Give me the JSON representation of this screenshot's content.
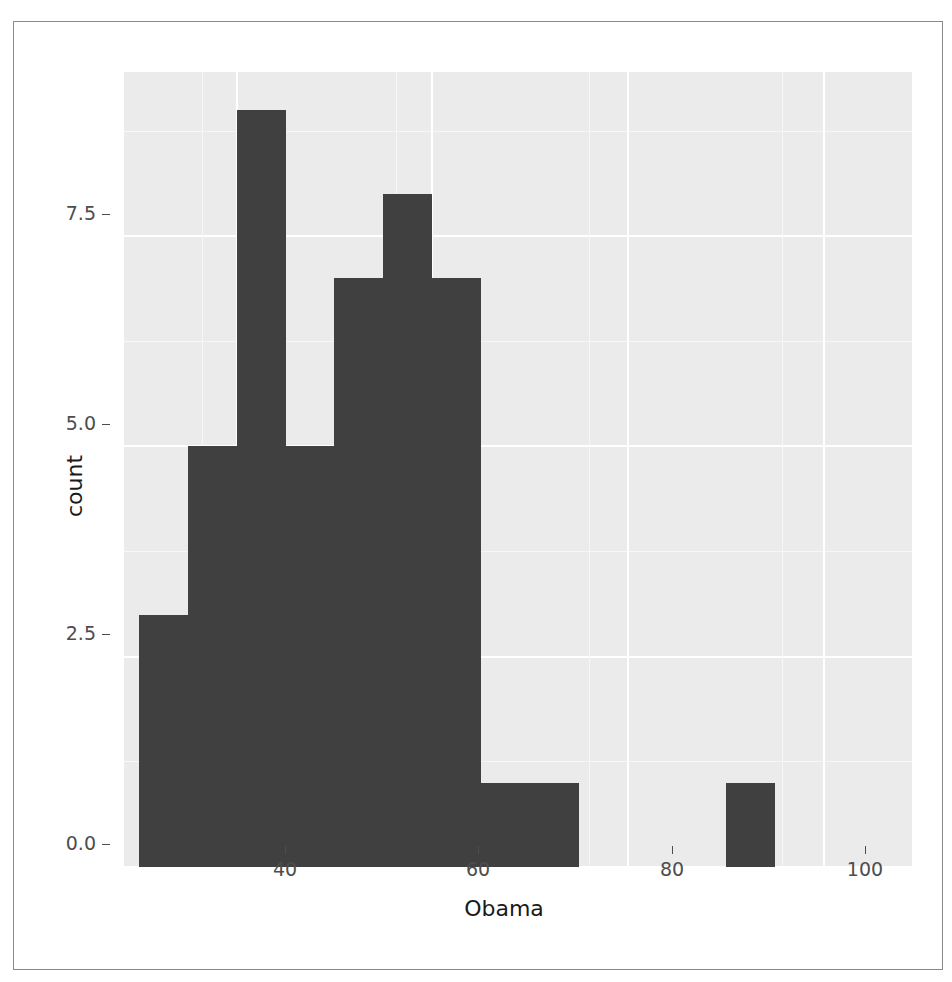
{
  "chart_data": {
    "type": "bar",
    "title": "",
    "subtitle": "",
    "xlabel": "Obama",
    "ylabel": "count",
    "xlim": [
      28.5,
      109.0
    ],
    "ylim": [
      0,
      9.45
    ],
    "grid": true,
    "legend": "none",
    "x_ticks": [
      {
        "value": 40,
        "label": "40"
      },
      {
        "value": 60,
        "label": "60"
      },
      {
        "value": 80,
        "label": "80"
      },
      {
        "value": 100,
        "label": "100"
      }
    ],
    "y_ticks": [
      {
        "value": 0.0,
        "label": "0.0"
      },
      {
        "value": 2.5,
        "label": "2.5"
      },
      {
        "value": 5.0,
        "label": "5.0"
      },
      {
        "value": 7.5,
        "label": "7.5"
      }
    ],
    "bin_width": 5,
    "bins": [
      {
        "x0": 30,
        "x1": 35,
        "count": 3
      },
      {
        "x0": 35,
        "x1": 40,
        "count": 5
      },
      {
        "x0": 40,
        "x1": 45,
        "count": 9
      },
      {
        "x0": 45,
        "x1": 50,
        "count": 5
      },
      {
        "x0": 50,
        "x1": 55,
        "count": 7
      },
      {
        "x0": 55,
        "x1": 60,
        "count": 8
      },
      {
        "x0": 60,
        "x1": 65,
        "count": 7
      },
      {
        "x0": 65,
        "x1": 70,
        "count": 1
      },
      {
        "x0": 70,
        "x1": 75,
        "count": 1
      },
      {
        "x0": 75,
        "x1": 80,
        "count": 0
      },
      {
        "x0": 80,
        "x1": 85,
        "count": 0
      },
      {
        "x0": 85,
        "x1": 90,
        "count": 0
      },
      {
        "x0": 90,
        "x1": 95,
        "count": 1
      }
    ],
    "categories": [
      "30-35",
      "35-40",
      "40-45",
      "45-50",
      "50-55",
      "55-60",
      "60-65",
      "65-70",
      "70-75",
      "75-80",
      "80-85",
      "85-90",
      "90-95"
    ],
    "values": [
      3,
      5,
      9,
      5,
      7,
      8,
      7,
      1,
      1,
      0,
      0,
      0,
      1
    ],
    "colors": {
      "bar_fill": "#404040",
      "panel_background": "#ebebeb",
      "grid_major": "#ffffff",
      "grid_minor": "#f7f7f7",
      "axis_text": "#4d4d4d",
      "axis_title": "#1a1a1a",
      "figure_background": "#ffffff",
      "frame_border": "#8a8a8a"
    }
  }
}
